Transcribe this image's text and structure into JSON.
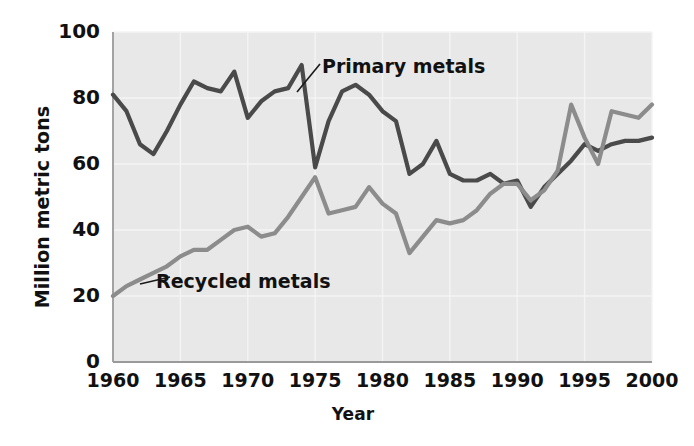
{
  "chart_data": {
    "type": "line",
    "title": "",
    "xlabel": "Year",
    "ylabel": "Million metric tons",
    "xlim": [
      1960,
      2000
    ],
    "ylim": [
      0,
      100
    ],
    "xticks": [
      "1960",
      "1965",
      "1970",
      "1975",
      "1980",
      "1985",
      "1990",
      "1995",
      "2000"
    ],
    "yticks": [
      "0",
      "20",
      "40",
      "60",
      "80",
      "100"
    ],
    "grid": true,
    "legend_position": "inline-annotations",
    "x": [
      1960,
      1961,
      1962,
      1963,
      1964,
      1965,
      1966,
      1967,
      1968,
      1969,
      1970,
      1971,
      1972,
      1973,
      1974,
      1975,
      1976,
      1977,
      1978,
      1979,
      1980,
      1981,
      1982,
      1983,
      1984,
      1985,
      1986,
      1987,
      1988,
      1989,
      1990,
      1991,
      1992,
      1993,
      1994,
      1995,
      1996,
      1997,
      1998,
      1999,
      2000
    ],
    "series": [
      {
        "name": "Primary metals",
        "color": "#4a4a4a",
        "values": [
          81,
          76,
          66,
          63,
          70,
          78,
          85,
          83,
          82,
          88,
          74,
          79,
          82,
          83,
          90,
          59,
          73,
          82,
          84,
          81,
          76,
          73,
          57,
          60,
          67,
          57,
          55,
          55,
          57,
          54,
          55,
          47,
          53,
          57,
          61,
          66,
          64,
          66,
          67,
          67,
          68
        ]
      },
      {
        "name": "Recycled metals",
        "color": "#8c8c8c",
        "values": [
          20,
          23,
          25,
          27,
          29,
          32,
          34,
          34,
          37,
          40,
          41,
          38,
          39,
          44,
          50,
          56,
          45,
          46,
          47,
          53,
          48,
          45,
          33,
          38,
          43,
          42,
          43,
          46,
          51,
          54,
          54,
          49,
          52,
          58,
          78,
          68,
          60,
          76,
          75,
          74,
          78
        ]
      }
    ],
    "annotations": [
      {
        "text": "Primary metals",
        "series": "Primary metals"
      },
      {
        "text": "Recycled metals",
        "series": "Recycled metals"
      }
    ]
  },
  "style": {
    "plot_background": "#e8e8e8",
    "grid_color": "#f4f4f4",
    "axis_color": "#9a9a9a",
    "text_color": "#111111"
  }
}
